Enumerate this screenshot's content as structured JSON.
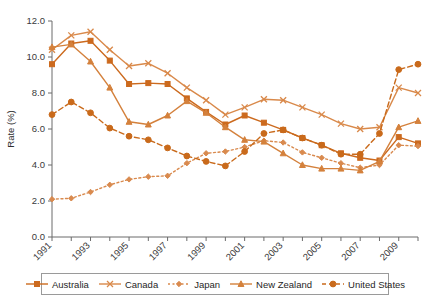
{
  "chart_data": {
    "type": "line",
    "title": "",
    "xlabel": "",
    "ylabel": "Rate (%)",
    "ylim": [
      0.0,
      12.0
    ],
    "yticks": [
      "0.0",
      "2.0",
      "4.0",
      "6.0",
      "8.0",
      "10.0",
      "12.0"
    ],
    "ytick_values": [
      0,
      2,
      4,
      6,
      8,
      10,
      12
    ],
    "grid": false,
    "legend_position": "bottom",
    "x": [
      1991,
      1992,
      1993,
      1994,
      1995,
      1996,
      1997,
      1998,
      1999,
      2000,
      2001,
      2002,
      2003,
      2004,
      2005,
      2006,
      2007,
      2008,
      2009,
      2010
    ],
    "xtick_labels": [
      "1991",
      "1993",
      "1995",
      "1997",
      "1999",
      "2001",
      "2003",
      "2005",
      "2007",
      "2009"
    ],
    "xtick_values": [
      1991,
      1993,
      1995,
      1997,
      1999,
      2001,
      2003,
      2005,
      2007,
      2009
    ],
    "series": [
      {
        "name": "Australia",
        "marker": "square",
        "dash": "solid",
        "color": "#CC6A1E",
        "values": [
          9.6,
          10.75,
          10.9,
          9.8,
          8.5,
          8.55,
          8.5,
          7.7,
          6.95,
          6.25,
          6.75,
          6.35,
          5.95,
          5.5,
          5.1,
          4.65,
          4.4,
          4.25,
          5.55,
          5.2
        ]
      },
      {
        "name": "Canada",
        "marker": "cross",
        "dash": "solid",
        "color": "#D9894A",
        "values": [
          10.4,
          11.2,
          11.4,
          10.4,
          9.5,
          9.65,
          9.1,
          8.3,
          7.6,
          6.8,
          7.2,
          7.65,
          7.6,
          7.2,
          6.8,
          6.3,
          6.0,
          6.1,
          8.3,
          8.0
        ]
      },
      {
        "name": "Japan",
        "marker": "diamond",
        "dash": "dotted",
        "color": "#D98A4E",
        "values": [
          2.1,
          2.15,
          2.5,
          2.9,
          3.2,
          3.35,
          3.4,
          4.1,
          4.65,
          4.75,
          5.0,
          5.35,
          5.25,
          4.7,
          4.4,
          4.1,
          3.85,
          4.0,
          5.1,
          5.05
        ]
      },
      {
        "name": "New Zealand",
        "marker": "triangle",
        "dash": "solid",
        "color": "#D4813C",
        "values": [
          10.55,
          10.7,
          9.75,
          8.3,
          6.4,
          6.25,
          6.75,
          7.55,
          6.9,
          6.1,
          5.4,
          5.3,
          4.65,
          4.0,
          3.8,
          3.8,
          3.7,
          4.2,
          6.1,
          6.45
        ]
      },
      {
        "name": "United States",
        "marker": "circle",
        "dash": "dashed",
        "color": "#C96A1B",
        "values": [
          6.8,
          7.5,
          6.9,
          6.05,
          5.6,
          5.4,
          4.95,
          4.5,
          4.2,
          3.95,
          4.75,
          5.75,
          5.95,
          5.5,
          5.1,
          4.6,
          4.6,
          5.75,
          9.3,
          9.6
        ]
      }
    ]
  },
  "legend": {
    "items": [
      {
        "label": "Australia",
        "marker": "square",
        "dash": "solid"
      },
      {
        "label": "Canada",
        "marker": "cross",
        "dash": "solid"
      },
      {
        "label": "Japan",
        "marker": "diamond",
        "dash": "dotted"
      },
      {
        "label": "New Zealand",
        "marker": "triangle",
        "dash": "solid"
      },
      {
        "label": "United States",
        "marker": "circle",
        "dash": "dashed"
      }
    ]
  },
  "colors": {
    "accent": "#CC6A1E",
    "axis": "#6b6b6b",
    "text": "#2e2e2e",
    "background": "#ffffff"
  }
}
